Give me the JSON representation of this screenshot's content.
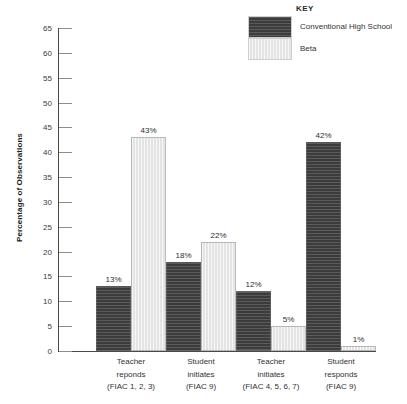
{
  "legend": {
    "title": "KEY",
    "entries": [
      {
        "label": "Conventional High School",
        "swatch": "dark-hatched-swatch",
        "color": "#3c3c3c"
      },
      {
        "label": "Beta",
        "swatch": "light-swatch",
        "color": "#e4e4e4"
      }
    ]
  },
  "axis": {
    "y_title": "Percentage of Observations",
    "y_ticks": [
      "0",
      "5",
      "10",
      "15",
      "20",
      "25",
      "30",
      "35",
      "40",
      "45",
      "50",
      "55",
      "60",
      "65"
    ]
  },
  "chart_data": {
    "type": "bar",
    "title": "",
    "xlabel": "",
    "ylabel": "Percentage of Observations",
    "ylim": [
      0,
      65
    ],
    "ytick_step": 5,
    "grid": false,
    "legend_position": "top-right",
    "legend_title": "KEY",
    "categories": [
      "Teacher reponds (FIAC 1, 2, 3)",
      "Student initiates (FIAC 9)",
      "Teacher initiates (FIAC 4, 5, 6, 7)",
      "Student responds (FIAC 9)"
    ],
    "category_lines": [
      [
        "Teacher",
        "reponds",
        "(FIAC 1, 2, 3)"
      ],
      [
        "Student",
        "initiates",
        "(FIAC 9)"
      ],
      [
        "Teacher",
        "initiates",
        "(FIAC 4, 5, 6, 7)"
      ],
      [
        "Student",
        "responds",
        "(FIAC 9)"
      ]
    ],
    "series": [
      {
        "name": "Conventional High School",
        "color": "#3c3c3c",
        "values": [
          13,
          18,
          12,
          42
        ],
        "labels": [
          "13%",
          "18%",
          "12%",
          "42%"
        ]
      },
      {
        "name": "Beta",
        "color": "#e4e4e4",
        "values": [
          43,
          22,
          5,
          1
        ],
        "labels": [
          "43%",
          "22%",
          "5%",
          "1%"
        ]
      }
    ]
  }
}
